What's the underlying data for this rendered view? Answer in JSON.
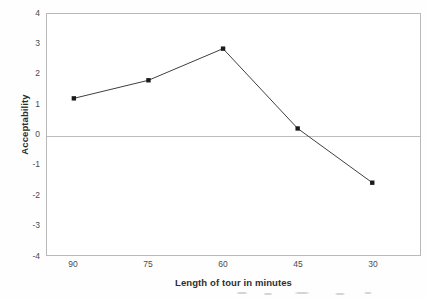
{
  "chart_data": {
    "type": "line",
    "title": "",
    "subtitle": "",
    "xlabel": "Length of tour in minutes",
    "ylabel": "Acceptability",
    "categories": [
      "90",
      "75",
      "60",
      "45",
      "30"
    ],
    "values": [
      1.2,
      1.8,
      2.85,
      0.2,
      -1.6
    ],
    "series": [
      {
        "name": "Acceptability",
        "values": [
          1.2,
          1.8,
          2.85,
          0.2,
          -1.6
        ]
      }
    ],
    "ylim": [
      -4,
      4
    ],
    "y_ticks": [
      "4",
      "3",
      "2",
      "1",
      "0",
      "-1",
      "-2",
      "-3",
      "-4"
    ],
    "y_tick_values": [
      4,
      3,
      2,
      1,
      0,
      -1,
      -2,
      -3,
      -4
    ],
    "grid": false,
    "zero_line": true,
    "legend": "none",
    "marker": "square",
    "line_color": "#3d3d3d",
    "marker_color": "#1a1a1a",
    "frame_color": "#b9b9b9",
    "zero_line_color": "#bdbdbd",
    "background_color": "#ffffff"
  }
}
